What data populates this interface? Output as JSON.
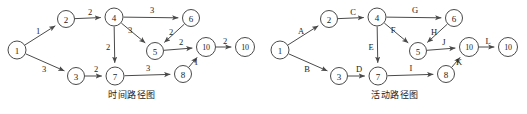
{
  "figure": {
    "background_color": "#ffffff",
    "stroke_color": "#4a4a4a",
    "text_color": "#1d1d1d"
  },
  "panels": [
    {
      "id": "time-path",
      "caption": "时间路径图",
      "nodes": [
        {
          "id": "n1",
          "label": "1",
          "x": 17,
          "y": 50,
          "r": 9
        },
        {
          "id": "n2",
          "label": "2",
          "x": 66,
          "y": 19,
          "r": 8.5
        },
        {
          "id": "n3",
          "label": "3",
          "x": 76,
          "y": 76,
          "r": 8.5
        },
        {
          "id": "n4",
          "label": "4",
          "x": 114,
          "y": 17,
          "r": 9
        },
        {
          "id": "n5",
          "label": "5",
          "x": 155,
          "y": 51,
          "r": 8.5
        },
        {
          "id": "n6",
          "label": "6",
          "x": 191,
          "y": 18,
          "r": 8.5
        },
        {
          "id": "n7",
          "label": "7",
          "x": 115,
          "y": 76,
          "r": 9
        },
        {
          "id": "n8",
          "label": "8",
          "x": 183,
          "y": 74,
          "r": 8.5
        },
        {
          "id": "n10a",
          "label": "10",
          "x": 206,
          "y": 47,
          "r": 9.5
        },
        {
          "id": "n10b",
          "label": "10",
          "x": 245,
          "y": 47,
          "r": 9.5
        }
      ],
      "edges": [
        {
          "id": "e1",
          "from": "n1",
          "to": "n2",
          "label": "1",
          "lx": 38,
          "ly": 31
        },
        {
          "id": "e2",
          "from": "n1",
          "to": "n3",
          "label": "3",
          "lx": 44,
          "ly": 69
        },
        {
          "id": "e3",
          "from": "n2",
          "to": "n4",
          "label": "2",
          "lx": 90,
          "ly": 12
        },
        {
          "id": "e4",
          "from": "n4",
          "to": "n6",
          "label": "3",
          "lx": 152,
          "ly": 10
        },
        {
          "id": "e5",
          "from": "n4",
          "to": "n5",
          "label": "3",
          "lx": 130,
          "ly": 30
        },
        {
          "id": "e6",
          "from": "n4",
          "to": "n7",
          "label": "2",
          "lx": 108,
          "ly": 47
        },
        {
          "id": "e7",
          "from": "n6",
          "to": "n5",
          "label": "2",
          "lx": 171,
          "ly": 32
        },
        {
          "id": "e8",
          "from": "n3",
          "to": "n7",
          "label": "2",
          "lx": 96,
          "ly": 69
        },
        {
          "id": "e9",
          "from": "n5",
          "to": "n10a",
          "label": "2",
          "lx": 181,
          "ly": 42
        },
        {
          "id": "e10",
          "from": "n7",
          "to": "n8",
          "label": "3",
          "lx": 148,
          "ly": 68
        },
        {
          "id": "e11",
          "from": "n8",
          "to": "n10a",
          "label": "1",
          "lx": 196,
          "ly": 62
        },
        {
          "id": "e12",
          "from": "n10a",
          "to": "n10b",
          "label": "2",
          "lx": 225,
          "ly": 41
        }
      ]
    },
    {
      "id": "activity-path",
      "caption": "活动路径图",
      "nodes": [
        {
          "id": "n1",
          "label": "1",
          "x": 17,
          "y": 50,
          "r": 9
        },
        {
          "id": "n2",
          "label": "2",
          "x": 66,
          "y": 19,
          "r": 8.5
        },
        {
          "id": "n3",
          "label": "3",
          "x": 76,
          "y": 76,
          "r": 8.5
        },
        {
          "id": "n4",
          "label": "4",
          "x": 114,
          "y": 17,
          "r": 9
        },
        {
          "id": "n5",
          "label": "5",
          "x": 155,
          "y": 51,
          "r": 8.5
        },
        {
          "id": "n6",
          "label": "6",
          "x": 191,
          "y": 18,
          "r": 8.5
        },
        {
          "id": "n7",
          "label": "7",
          "x": 115,
          "y": 76,
          "r": 9
        },
        {
          "id": "n8",
          "label": "8",
          "x": 183,
          "y": 74,
          "r": 8.5
        },
        {
          "id": "n10a",
          "label": "10",
          "x": 206,
          "y": 47,
          "r": 9.5
        },
        {
          "id": "n10b",
          "label": "10",
          "x": 245,
          "y": 47,
          "r": 9.5
        }
      ],
      "edges": [
        {
          "id": "e1",
          "from": "n1",
          "to": "n2",
          "label": "A",
          "lx": 38,
          "ly": 31
        },
        {
          "id": "e2",
          "from": "n1",
          "to": "n3",
          "label": "B",
          "lx": 44,
          "ly": 69
        },
        {
          "id": "e3",
          "from": "n2",
          "to": "n4",
          "label": "C",
          "lx": 90,
          "ly": 12
        },
        {
          "id": "e4",
          "from": "n4",
          "to": "n6",
          "label": "G",
          "lx": 152,
          "ly": 10
        },
        {
          "id": "e5",
          "from": "n4",
          "to": "n5",
          "label": "F",
          "lx": 130,
          "ly": 30
        },
        {
          "id": "e6",
          "from": "n4",
          "to": "n7",
          "label": "E",
          "lx": 108,
          "ly": 47
        },
        {
          "id": "e7",
          "from": "n6",
          "to": "n5",
          "label": "H",
          "lx": 171,
          "ly": 32
        },
        {
          "id": "e8",
          "from": "n3",
          "to": "n7",
          "label": "D",
          "lx": 96,
          "ly": 69
        },
        {
          "id": "e9",
          "from": "n5",
          "to": "n10a",
          "label": "J",
          "lx": 181,
          "ly": 42
        },
        {
          "id": "e10",
          "from": "n7",
          "to": "n8",
          "label": "I",
          "lx": 148,
          "ly": 68
        },
        {
          "id": "e11",
          "from": "n8",
          "to": "n10a",
          "label": "K",
          "lx": 196,
          "ly": 62
        },
        {
          "id": "e12",
          "from": "n10a",
          "to": "n10b",
          "label": "L",
          "lx": 225,
          "ly": 41
        }
      ]
    }
  ]
}
